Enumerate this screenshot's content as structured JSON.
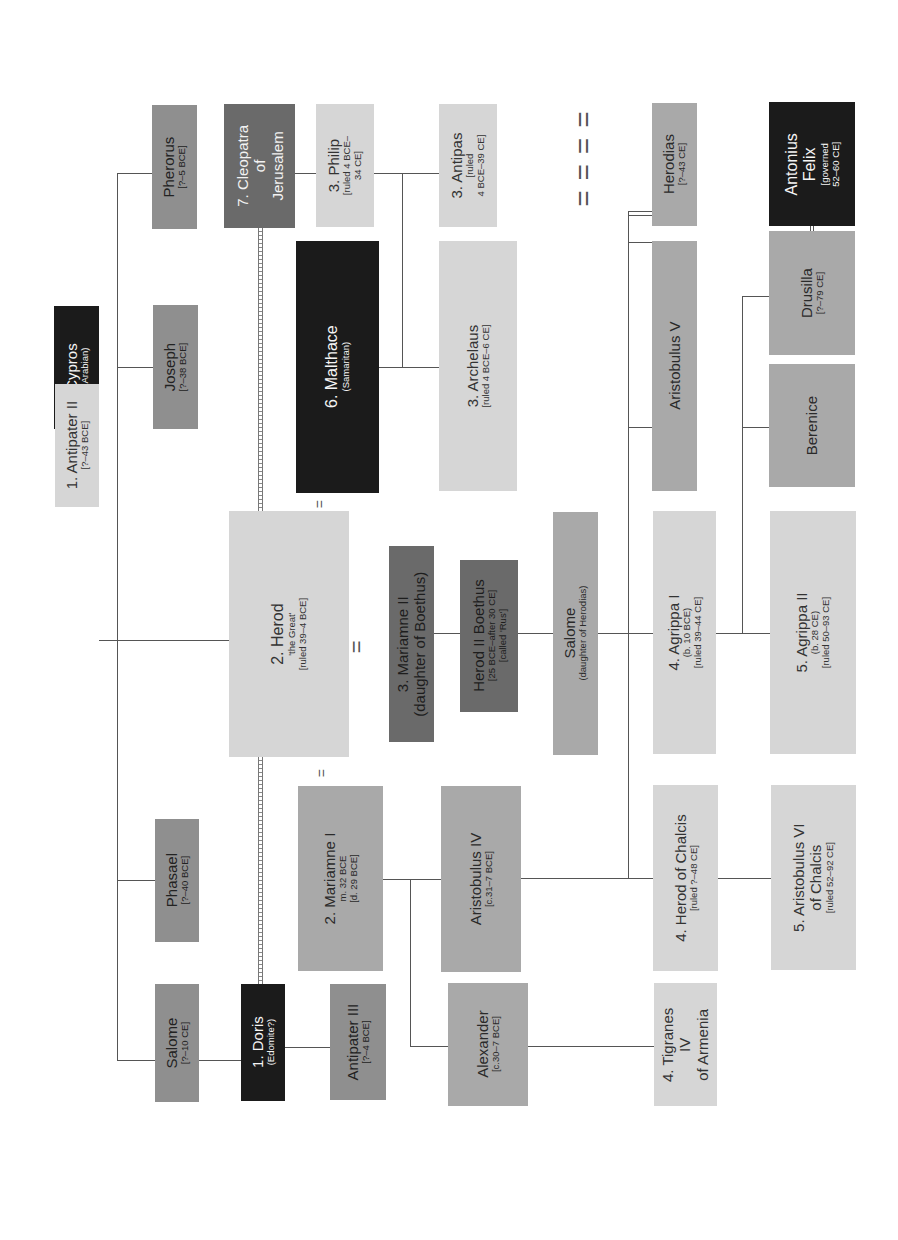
{
  "diagram": {
    "orientation": "rotated 90 degrees counter-clockwise",
    "colors": {
      "light": "#d6d6d6",
      "mid": "#a9a9a9",
      "mid_dark": "#8f8f8f",
      "dark": "#6a6a6a",
      "black": "#1b1b1b",
      "line": "#555555"
    },
    "people": {
      "cypros": {
        "name": "Cypros",
        "sub": "(Arabian)"
      },
      "antipater_ii": {
        "name": "1. Antipater II",
        "sub": "[?–43 BCE]"
      },
      "joseph": {
        "name": "Joseph",
        "sub": "[?–38 BCE]"
      },
      "pherorus": {
        "name": "Pherorus",
        "sub": "[?–5 BCE]"
      },
      "phasael": {
        "name": "Phasael",
        "sub": "[?–40 BCE]"
      },
      "salome_sister": {
        "name": "Salome",
        "sub": "[?–10 CE]"
      },
      "herod": {
        "name": "2. Herod",
        "sub1": "'the Great'",
        "sub2": "[ruled 39–4 BCE]"
      },
      "cleopatra": {
        "name1": "7. Cleopatra",
        "name2": "of",
        "name3": "Jerusalem"
      },
      "malthace": {
        "name": "6. Malthace",
        "sub": "(Samaritan)"
      },
      "mariamne_ii": {
        "name1": "3. Mariamne II",
        "name2": "(daughter of Boethus)"
      },
      "mariamne_i": {
        "name": "2. Mariamne I",
        "sub1": "m. 32 BCE",
        "sub2": "[d. 29 BCE]"
      },
      "doris": {
        "name": "1. Doris",
        "sub": "(Edomite?)"
      },
      "philip": {
        "name": "3. Philip",
        "sub1": "[ruled 4 BCE–",
        "sub2": "34 CE]"
      },
      "antipas": {
        "name": "3. Antipas",
        "sub1": "[ruled",
        "sub2": "4 BCE–39 CE]"
      },
      "archelaus": {
        "name": "3. Archelaus",
        "sub": "[ruled 4 BCE–6 CE]"
      },
      "herod_ii_boethus": {
        "name": "Herod II Boethus",
        "sub1": "[25 BCE–after 30 CE]",
        "sub2": "[called 'Rus']"
      },
      "aristobulus_iv": {
        "name": "Aristobulus IV",
        "sub": "[c.31–7 BCE]"
      },
      "alexander": {
        "name": "Alexander",
        "sub": "[c.30–7 BCE]"
      },
      "antipater_iii": {
        "name": "Antipater III",
        "sub": "[?–4 BCE]"
      },
      "herodias": {
        "name": "Herodias",
        "sub": "[?–43 CE]"
      },
      "aristobulus_v": {
        "name": "Aristobulus V"
      },
      "salome_daughter": {
        "name": "Salome",
        "sub": "(daughter of Herodias)"
      },
      "agrippa_i": {
        "name": "4. Agrippa I",
        "sub1": "(b. 10 BCE)",
        "sub2": "[ruled 39–44 CE]"
      },
      "herod_chalcis": {
        "name": "4. Herod of Chalcis",
        "sub": "[ruled ?–48 CE]"
      },
      "tigranes": {
        "name1": "4. Tigranes",
        "name2": "IV",
        "name3": "of Armenia"
      },
      "antonius_felix": {
        "name1": "Antonius",
        "name2": "Felix",
        "sub1": "[governed",
        "sub2": "52–60 CE]"
      },
      "drusilla": {
        "name": "Drusilla",
        "sub": "[?–79 CE]"
      },
      "berenice": {
        "name": "Berenice"
      },
      "agrippa_ii": {
        "name": "5. Agrippa II",
        "sub1": "(b. 28 CE)",
        "sub2": "[ruled 50–93 CE]"
      },
      "aristobulus_vi": {
        "name1": "5. Aristobulus VI",
        "name2": "of Chalcis",
        "sub": "[ruled 52–92 CE]"
      }
    },
    "marriage_symbol": "="
  }
}
